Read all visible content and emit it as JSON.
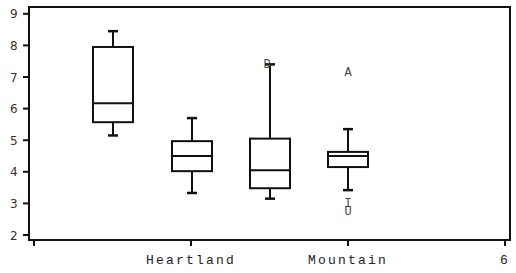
{
  "chart_data": {
    "type": "box",
    "title": "",
    "xlabel": "",
    "ylabel": "",
    "ylim": [
      2,
      9
    ],
    "yticks": [
      2,
      3,
      4,
      5,
      6,
      7,
      8,
      9
    ],
    "xtick_labels": [
      "",
      "Heartland",
      "Mountain",
      "6"
    ],
    "grid": false,
    "legend": null,
    "boxes": [
      {
        "x": 1,
        "whisker_high": 8.45,
        "q3": 7.95,
        "median": 6.17,
        "q1": 5.57,
        "whisker_low": 5.15,
        "outliers": []
      },
      {
        "x": 2,
        "whisker_high": 5.7,
        "q3": 4.97,
        "median": 4.5,
        "q1": 4.02,
        "whisker_low": 3.33,
        "outliers": []
      },
      {
        "x": 3,
        "whisker_high": 7.4,
        "q3": 5.05,
        "median": 4.05,
        "q1": 3.48,
        "whisker_low": 3.15,
        "outliers": [
          {
            "label": "D",
            "value": 7.4
          }
        ]
      },
      {
        "x": 4,
        "whisker_high": 5.35,
        "q3": 4.63,
        "median": 4.5,
        "q1": 4.15,
        "whisker_low": 3.42,
        "outliers": [
          {
            "label": "A",
            "value": 7.15
          },
          {
            "label": "I",
            "value": 3.0
          },
          {
            "label": "U",
            "value": 2.75
          }
        ]
      }
    ]
  },
  "colors": {
    "line": "#111111",
    "text": "#333333",
    "background": "#ffffff"
  }
}
